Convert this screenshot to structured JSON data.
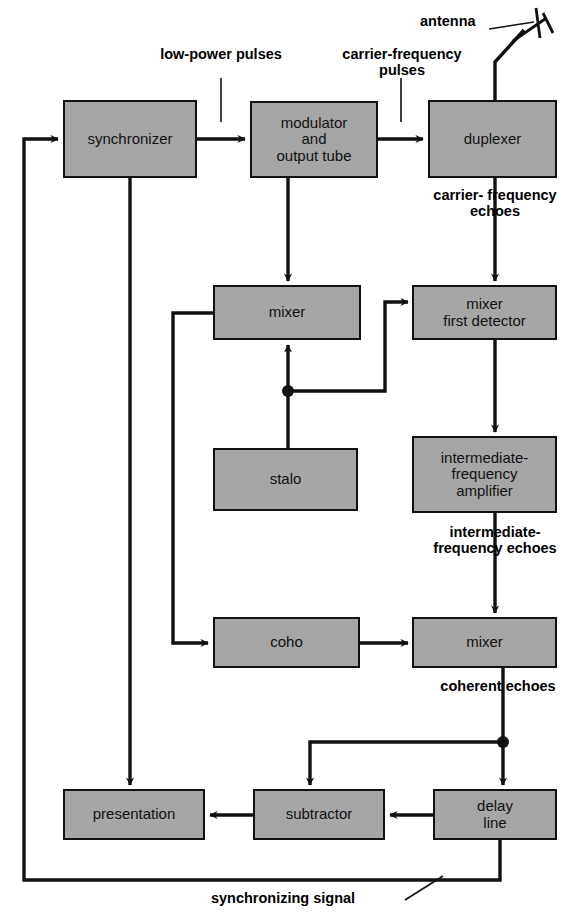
{
  "diagram": {
    "fill_color": "#a6a6a6",
    "line_color": "#111111",
    "boxes": {
      "synchronizer": "synchronizer",
      "modulator": "modulator\nand\noutput tube",
      "modulator_l1": "modulator",
      "modulator_l2": "and",
      "modulator_l3": "output tube",
      "duplexer": "duplexer",
      "mixer_top": "mixer",
      "mixer_first_detector_l1": "mixer",
      "mixer_first_detector_l2": "first detector",
      "stalo": "stalo",
      "if_amplifier_l1": "intermediate-",
      "if_amplifier_l2": "frequency",
      "if_amplifier_l3": "amplifier",
      "coho": "coho",
      "mixer_bottom": "mixer",
      "presentation": "presentation",
      "subtractor": "subtractor",
      "delay_line_l1": "delay",
      "delay_line_l2": "line"
    },
    "labels": {
      "antenna": "antenna",
      "low_power_pulses_l1": "low-power",
      "low_power_pulses_l2": "pulses",
      "carrier_frequency_pulses_l1": "carrier-frequency",
      "carrier_frequency_pulses_l2": "pulses",
      "carrier_frequency_echoes_l1": "carrier-",
      "carrier_frequency_echoes_l2": "frequency",
      "carrier_frequency_echoes_l3": "echoes",
      "intermediate_frequency_echoes_l1": "intermediate-",
      "intermediate_frequency_echoes_l2": "frequency",
      "intermediate_frequency_echoes_l3": "echoes",
      "coherent_echoes_l1": "coherent",
      "coherent_echoes_l2": "echoes",
      "synchronizing_signal": "synchronizing signal"
    }
  }
}
